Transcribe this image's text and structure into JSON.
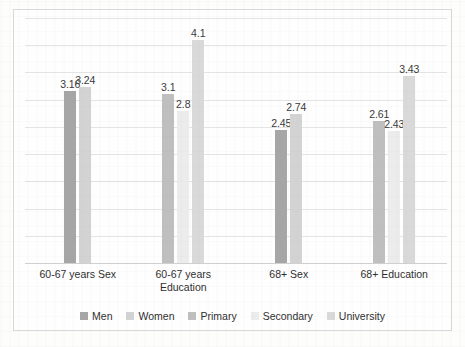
{
  "chart_data": {
    "type": "bar",
    "title": "",
    "subtitle": "",
    "xlabel": "",
    "ylabel": "",
    "ylim": [
      0,
      4.5
    ],
    "grid": true,
    "gridline_interval": 0.5,
    "y_tick_labels_shown": false,
    "legend_position": "bottom",
    "categories": [
      "60-67 years Sex",
      "60-67 years Education",
      "68+ Sex",
      "68+ Education"
    ],
    "series": [
      {
        "name": "Men",
        "color": "#a6a6a6",
        "values": [
          3.16,
          null,
          2.45,
          null
        ]
      },
      {
        "name": "Women",
        "color": "#d3d3d3",
        "values": [
          3.24,
          null,
          2.74,
          null
        ]
      },
      {
        "name": "Primary",
        "color": "#bfbfbf",
        "values": [
          null,
          3.1,
          null,
          2.61
        ]
      },
      {
        "name": "Secondary",
        "color": "#ececec",
        "values": [
          null,
          2.8,
          null,
          2.43
        ]
      },
      {
        "name": "University",
        "color": "#d9d9d9",
        "values": [
          null,
          4.1,
          null,
          3.43
        ]
      }
    ],
    "data_labels": [
      "3.16",
      "3.24",
      "3.1",
      "2.8",
      "4.1",
      "2.45",
      "2.74",
      "2.61",
      "2.43",
      "3.43"
    ]
  },
  "legend": {
    "items": [
      {
        "label": "Men"
      },
      {
        "label": "Women"
      },
      {
        "label": "Primary"
      },
      {
        "label": "Secondary"
      },
      {
        "label": "University"
      }
    ]
  },
  "axis": {
    "categories": [
      "60-67 years Sex",
      "60-67 years Education",
      "68+ Sex",
      "68+ Education"
    ]
  },
  "colors": {
    "frame_border": "#d9d9d9",
    "gridline": "#e4e4e4",
    "label_text": "#3a3a3a",
    "plot_background": "#fefefe"
  }
}
